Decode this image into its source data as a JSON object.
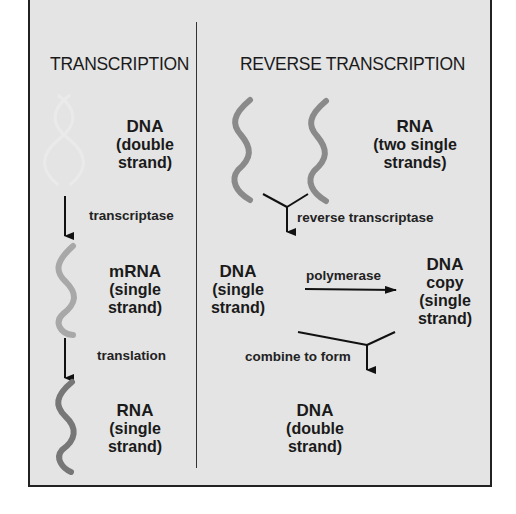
{
  "columns": {
    "left": {
      "title": "TRANSCRIPTION",
      "steps": [
        {
          "molecule": "DNA",
          "line1": "(double",
          "line2": "strand)"
        },
        {
          "enzyme": "transcriptase"
        },
        {
          "molecule": "mRNA",
          "line1": "(single",
          "line2": "strand)"
        },
        {
          "enzyme": "translation"
        },
        {
          "molecule": "RNA",
          "line1": "(single",
          "line2": "strand)"
        }
      ]
    },
    "right": {
      "title": "REVERSE TRANSCRIPTION",
      "rna": {
        "molecule": "RNA",
        "line1": "(two single",
        "line2": "strands)"
      },
      "enzyme1": "reverse transcriptase",
      "dna_single": {
        "molecule": "DNA",
        "line1": "(single",
        "line2": "strand)"
      },
      "enzyme2": "polymerase",
      "dna_copy": {
        "molecule": "DNA",
        "line0": "copy",
        "line1": "(single",
        "line2": "strand)"
      },
      "enzyme3": "combine to form",
      "dna_double": {
        "molecule": "DNA",
        "line1": "(double",
        "line2": "strand)"
      }
    }
  },
  "colors": {
    "panel_bg": "#e4e4e4",
    "strand": "#8a8a8a",
    "strand_light": "#a8a8a8",
    "strand_dark": "#777777",
    "ink": "#1a1a1a"
  }
}
